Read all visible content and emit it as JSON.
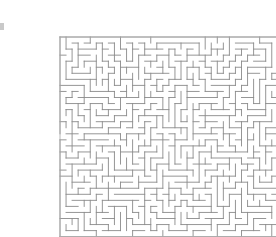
{
  "figure": {
    "kind": "rectangular-perfect-maze",
    "background_color": "#ffffff",
    "wall_color": "#8a8a8a",
    "wall_width": 0.9,
    "canvas": {
      "width": 276,
      "height": 237
    }
  },
  "maze": {
    "origin_x": 20,
    "origin_y": 21,
    "cell_size": 6.05,
    "cols": 40,
    "rows": 33,
    "seed": 20240517,
    "border_color": "#b0b0b0",
    "border_width": 0.9,
    "entrance": {
      "side": "left",
      "cell_row": 16
    },
    "exit": {
      "side": "right",
      "cell_row": 20
    }
  },
  "marks": {
    "left_edge_tick": {
      "x": 0,
      "y": 23,
      "width": 4,
      "height": 7,
      "color": "#c9c9c9"
    }
  }
}
